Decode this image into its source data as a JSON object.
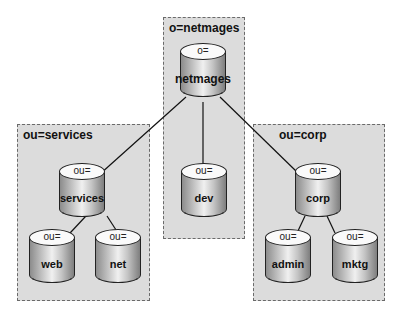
{
  "diagram": {
    "groups": [
      {
        "id": "netmages",
        "label": "o=netmages"
      },
      {
        "id": "services",
        "label": "ou=services"
      },
      {
        "id": "corp",
        "label": "ou=corp"
      }
    ],
    "nodes": {
      "netmages": {
        "attr": "o=",
        "name": "netmages"
      },
      "services": {
        "attr": "ou=",
        "name": "services"
      },
      "dev": {
        "attr": "ou=",
        "name": "dev"
      },
      "corp": {
        "attr": "ou=",
        "name": "corp"
      },
      "web": {
        "attr": "ou=",
        "name": "web"
      },
      "net": {
        "attr": "ou=",
        "name": "net"
      },
      "admin": {
        "attr": "ou=",
        "name": "admin"
      },
      "mktg": {
        "attr": "ou=",
        "name": "mktg"
      }
    },
    "edges": [
      [
        "netmages",
        "services"
      ],
      [
        "netmages",
        "dev"
      ],
      [
        "netmages",
        "corp"
      ],
      [
        "services",
        "web"
      ],
      [
        "services",
        "net"
      ],
      [
        "corp",
        "admin"
      ],
      [
        "corp",
        "mktg"
      ]
    ]
  }
}
